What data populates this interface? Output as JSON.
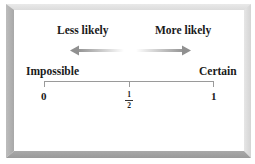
{
  "diagram": {
    "type": "probability-scale",
    "arrows": {
      "left_label": "Less likely",
      "right_label": "More likely"
    },
    "endpoints": {
      "left_label": "Impossible",
      "right_label": "Certain"
    },
    "ticks": [
      {
        "label": "0"
      },
      {
        "label": "1/2",
        "numerator": "1",
        "denominator": "2"
      },
      {
        "label": "1"
      }
    ],
    "colors": {
      "text": "#1a1a1a",
      "arrow": "#9a9a9a",
      "axis": "#8a8a8a",
      "frame_dark": "#a0a0a0",
      "frame_light": "#e0e0e0"
    }
  }
}
